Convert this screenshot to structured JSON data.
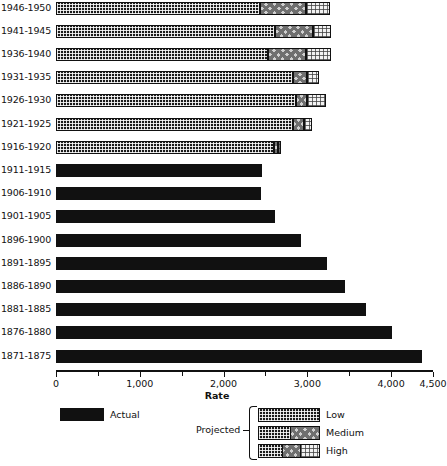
{
  "chart_data": {
    "type": "bar",
    "orientation": "horizontal",
    "stacked": true,
    "title": "",
    "xlabel": "Rate",
    "ylabel": "",
    "xlim": [
      0,
      4500
    ],
    "xticks": [
      0,
      1000,
      2000,
      3000,
      4000,
      4500
    ],
    "xtick_labels": [
      "0",
      "1,000",
      "2,000",
      "3,000",
      "4,000",
      "4,500"
    ],
    "minor_xticks": [
      500,
      1500,
      2500,
      3500
    ],
    "grid": false,
    "categories": [
      "1946-1950",
      "1941-1945",
      "1936-1940",
      "1931-1935",
      "1926-1930",
      "1921-1925",
      "1916-1920",
      "1911-1915",
      "1906-1910",
      "1901-1905",
      "1896-1900",
      "1891-1895",
      "1886-1890",
      "1881-1885",
      "1876-1880",
      "1871-1875"
    ],
    "series": [
      {
        "name": "Actual",
        "key": "actual",
        "values": [
          0,
          0,
          0,
          0,
          0,
          0,
          0,
          2455,
          2450,
          2620,
          2930,
          3230,
          3450,
          3700,
          4010,
          4370
        ]
      },
      {
        "name": "Low",
        "key": "low",
        "values": [
          2440,
          2620,
          2535,
          2825,
          2860,
          2825,
          2600,
          0,
          0,
          0,
          0,
          0,
          0,
          0,
          0,
          0
        ]
      },
      {
        "name": "Medium",
        "key": "medium",
        "values": [
          540,
          445,
          445,
          170,
          135,
          130,
          45,
          0,
          0,
          0,
          0,
          0,
          0,
          0,
          0,
          0
        ]
      },
      {
        "name": "High",
        "key": "high",
        "values": [
          290,
          215,
          300,
          145,
          225,
          100,
          40,
          0,
          0,
          0,
          0,
          0,
          0,
          0,
          0,
          0
        ]
      }
    ],
    "legend": {
      "position": "below",
      "actual_label": "Actual",
      "projected_label": "Projected",
      "projected_entries": [
        "Low",
        "Medium",
        "High"
      ]
    },
    "colors": {
      "actual": "#111111",
      "low": "#1b1b1b",
      "medium": "#cfcfcf",
      "high": "#f2f2f2",
      "axis": "#111111",
      "background": "#ffffff"
    }
  }
}
